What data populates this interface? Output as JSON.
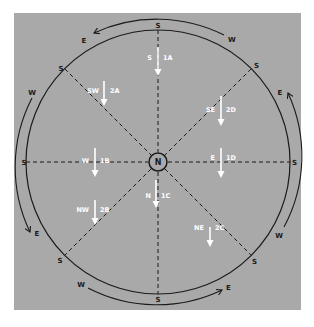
{
  "header": {
    "clipped_text": "’ ’ ’ ’   ’ ’ ’ ’"
  },
  "diagram": {
    "center_label": "N",
    "ring_labels": {
      "top": "S",
      "top_right": "S",
      "right": "S",
      "bottom_right": "S",
      "bottom": "S",
      "bottom_left": "S",
      "left": "S",
      "top_left": "S"
    },
    "outer_arc_labels": {
      "top_start": "W",
      "top_end": "E",
      "right_start": "W",
      "right_end": "E",
      "bottom_start": "W",
      "bottom_end": "E",
      "left_start": "W",
      "left_end": "E"
    },
    "sectors": [
      {
        "dir": "S",
        "code": "1A"
      },
      {
        "dir": "SE",
        "code": "2D"
      },
      {
        "dir": "E",
        "code": "1D"
      },
      {
        "dir": "NE",
        "code": "2C"
      },
      {
        "dir": "N",
        "code": "1C"
      },
      {
        "dir": "NW",
        "code": "2B"
      },
      {
        "dir": "W",
        "code": "1B"
      },
      {
        "dir": "SW",
        "code": "2A"
      }
    ]
  },
  "colors": {
    "panel": "#a9a9a9",
    "line": "#1a1a1a",
    "arrow": "#ffffff"
  }
}
